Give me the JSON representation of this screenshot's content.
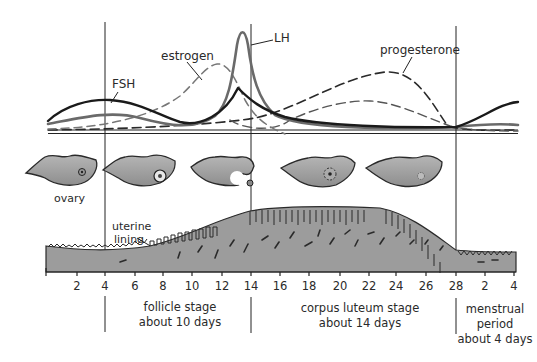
{
  "figure": {
    "labels": {
      "fsh": "FSH",
      "lh": "LH",
      "estrogen": "estrogen",
      "progesterone": "progesterone",
      "ovary": "ovary",
      "uterine_lining_line1": "uterine",
      "uterine_lining_line2": "lining"
    },
    "axis": {
      "ticks": [
        "2",
        "4",
        "6",
        "8",
        "10",
        "12",
        "14",
        "16",
        "18",
        "20",
        "22",
        "24",
        "26",
        "28",
        "2",
        "4"
      ]
    },
    "stages": [
      {
        "line1": "follicle stage",
        "line2": "about 10 days"
      },
      {
        "line1": "corpus luteum stage",
        "line2": "about 14 days"
      },
      {
        "line1": "menstrual",
        "line2": "period",
        "line3": "about 4 days"
      }
    ],
    "ovary_stages": [
      "small follicle",
      "growing follicle",
      "ovulation (egg released)",
      "corpus luteum",
      "degenerating corpus luteum"
    ],
    "colors": {
      "fsh": "#1a1a1a",
      "lh": "#6a6a6a",
      "estrogen": "#777777",
      "progesterone": "#2a2a2a",
      "tissue": "#9a9a9a",
      "tissue_outline": "#2a2a2a",
      "divider": "#222222"
    }
  }
}
